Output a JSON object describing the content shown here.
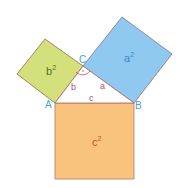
{
  "diagram": {
    "vertices": {
      "A": "A",
      "B": "B",
      "C": "C"
    },
    "sides": {
      "a": "a",
      "b": "b",
      "c": "c"
    },
    "squares": {
      "a2": "a",
      "b2": "b",
      "c2": "c"
    },
    "exponent": "2",
    "right_angle_mark": "·",
    "colors": {
      "a_square": "#8fc9ef",
      "b_square": "#d3e07c",
      "c_square": "#f9c37e",
      "vertex_label": "#4a9fd8",
      "side_label": "#b05070",
      "outline": "#a06a6a"
    }
  }
}
